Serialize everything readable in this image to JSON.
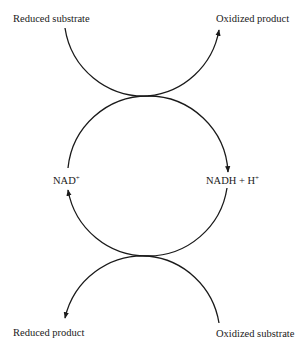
{
  "diagram": {
    "type": "coupled redox cycle",
    "labels": {
      "top_left": "Reduced substrate",
      "top_right": "Oxidized product",
      "middle_left": "NAD",
      "middle_left_sup": "+",
      "middle_right": "NADH + H",
      "middle_right_sup": "+",
      "bottom_left": "Reduced product",
      "bottom_right": "Oxidized substrate"
    },
    "colors": {
      "line": "#1a1a1a",
      "background": "#ffffff"
    }
  }
}
